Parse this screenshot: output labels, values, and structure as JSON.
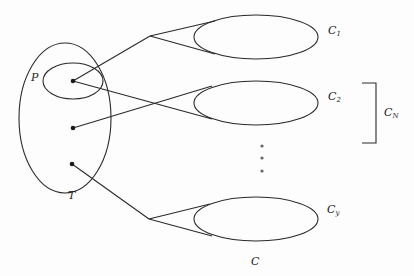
{
  "diagram": {
    "type": "set-mapping-diagram",
    "stroke_color": "#2a2a2a",
    "outer_set": {
      "label": "T"
    },
    "inner_set": {
      "label": "P"
    },
    "target_set": {
      "label": "C"
    },
    "clusters": [
      {
        "label_main": "C",
        "label_sub": "1"
      },
      {
        "label_main": "C",
        "label_sub": "2"
      },
      {
        "label_main": "C",
        "label_sub": "y"
      }
    ],
    "bracket": {
      "label_main": "C",
      "label_sub": "N"
    },
    "ellipsis": "⋮"
  }
}
